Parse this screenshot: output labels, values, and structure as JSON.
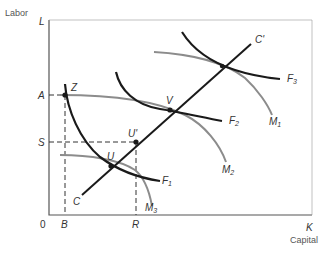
{
  "diagram": {
    "y_axis_title": "Labor",
    "x_axis_title": "Capital",
    "y_axis_end": "L",
    "x_axis_end": "K",
    "origin": "0",
    "y_ticks": {
      "A": "A",
      "S": "S"
    },
    "x_ticks": {
      "B": "B",
      "R": "R"
    },
    "points": {
      "Z": "Z",
      "U": "U",
      "U_prime": "U'",
      "V": "V"
    },
    "contract_curve": {
      "start": "C",
      "end": "C'"
    },
    "isoquants_F": [
      "F",
      "F",
      "F"
    ],
    "isoquants_F_sub": [
      "1",
      "2",
      "3"
    ],
    "isoquants_M": [
      "M",
      "M",
      "M"
    ],
    "isoquants_M_sub": [
      "1",
      "2",
      "3"
    ],
    "colors": {
      "dark_curve": "#1a1a1a",
      "gray_curve": "#8c8c8c",
      "axis": "#555555"
    }
  }
}
